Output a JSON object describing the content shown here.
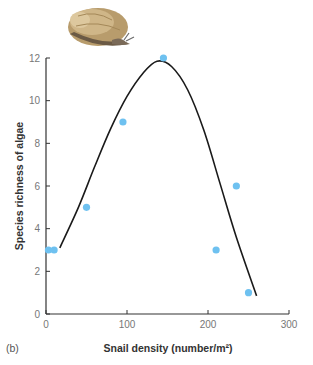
{
  "panel_label": "(b)",
  "chart_data": {
    "type": "scatter",
    "title": "",
    "xlabel": "Snail density (number/m²)",
    "ylabel": "Species richness of algae",
    "xlim": [
      0,
      300
    ],
    "ylim": [
      0,
      12
    ],
    "x_ticks": [
      0,
      100,
      200,
      300
    ],
    "y_ticks": [
      0,
      2,
      4,
      6,
      8,
      10,
      12
    ],
    "grid": false,
    "legend": "none",
    "illustration": "snail-image",
    "series": [
      {
        "name": "observations",
        "kind": "scatter",
        "color": "#6EC1F0",
        "x": [
          3,
          10,
          50,
          95,
          145,
          210,
          235,
          250
        ],
        "y": [
          3,
          3,
          5,
          9,
          12,
          3,
          6,
          1
        ]
      },
      {
        "name": "fitted-curve",
        "kind": "line",
        "color": "#1a1a1a",
        "x": [
          17,
          40,
          60,
          80,
          100,
          120,
          137,
          155,
          175,
          195,
          215,
          235,
          260
        ],
        "y": [
          3.1,
          5.0,
          6.9,
          8.7,
          10.2,
          11.3,
          11.85,
          11.6,
          10.5,
          8.6,
          6.1,
          3.6,
          0.85
        ]
      }
    ]
  }
}
